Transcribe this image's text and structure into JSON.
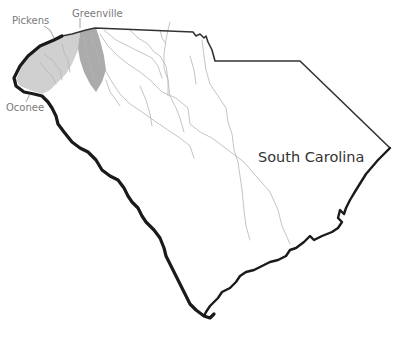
{
  "map": {
    "title": "South Carolina",
    "counties": [
      {
        "name": "Pickens",
        "fill": "#d0d0d0"
      },
      {
        "name": "Greenville",
        "fill": "#ababab"
      },
      {
        "name": "Oconee",
        "fill": "#d0d0d0"
      }
    ],
    "labels": {
      "state": "South Carolina",
      "pickens": "Pickens",
      "greenville": "Greenville",
      "oconee": "Oconee"
    },
    "colors": {
      "background": "#ffffff",
      "border": "#1a1a1a",
      "rivers": "#b5b5b5",
      "highlight_light": "#d0d0d0",
      "highlight_dark": "#ababab",
      "label_text": "#7a7a7a"
    }
  }
}
